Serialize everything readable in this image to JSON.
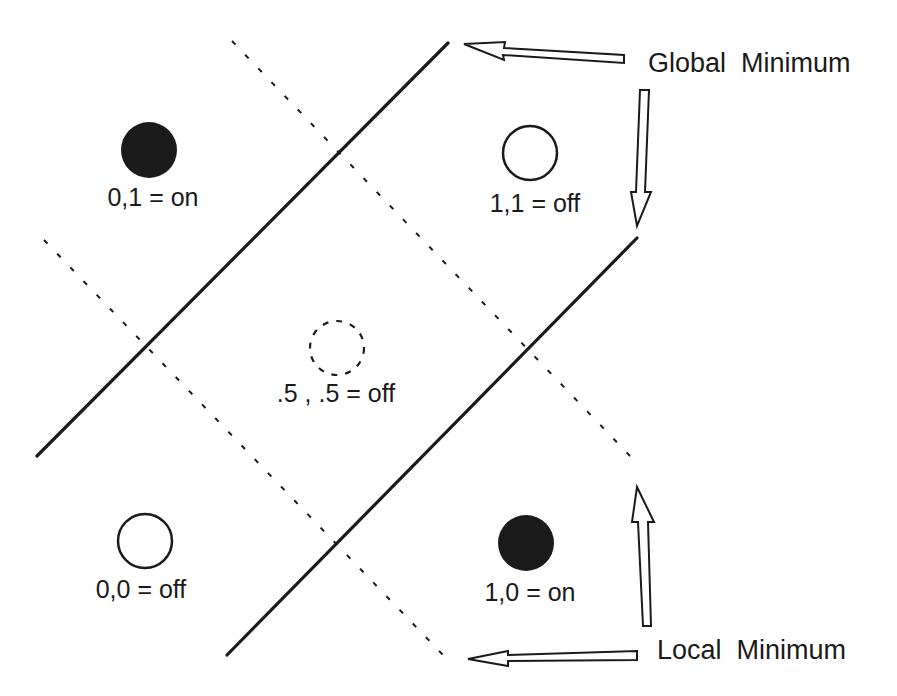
{
  "diagram": {
    "type": "xor-decision-boundaries",
    "colors": {
      "ink": "#1a1a1a",
      "background": "#ffffff"
    },
    "points": [
      {
        "id": "p01",
        "label": "0,1 = on",
        "x": 0,
        "y": 1,
        "state": "on",
        "style": "filled"
      },
      {
        "id": "p11",
        "label": "1,1 = off",
        "x": 1,
        "y": 1,
        "state": "off",
        "style": "open"
      },
      {
        "id": "p55",
        "label": ".5 , .5 = off",
        "x": 0.5,
        "y": 0.5,
        "state": "off",
        "style": "dashed"
      },
      {
        "id": "p00",
        "label": "0,0 = off",
        "x": 0,
        "y": 0,
        "state": "off",
        "style": "open"
      },
      {
        "id": "p10",
        "label": "1,0 = on",
        "x": 1,
        "y": 0,
        "state": "on",
        "style": "filled"
      }
    ],
    "annotations": {
      "global_minimum": "Global  Minimum",
      "local_minimum": "Local  Minimum"
    },
    "lines": {
      "solid": [
        "global-minimum-boundary-upper",
        "global-minimum-boundary-lower"
      ],
      "dashed": [
        "local-minimum-boundary-upper",
        "local-minimum-boundary-lower"
      ]
    }
  }
}
